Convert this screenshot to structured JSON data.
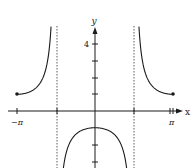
{
  "chart_data": {
    "type": "line",
    "title": "",
    "function": "y = -sec x",
    "xlabel": "x",
    "ylabel": "y",
    "xlim": [
      -3.14159,
      3.14159
    ],
    "ylim": [
      -3.4,
      5
    ],
    "x_tick_labels": [
      {
        "value": -3.14159,
        "label": "−π"
      },
      {
        "value": 3.14159,
        "label": "π"
      }
    ],
    "y_tick_labels": [
      {
        "value": 4,
        "label": "4"
      }
    ],
    "y_ticks": [
      -3,
      -2,
      -1,
      1,
      2,
      3,
      4
    ],
    "asymptotes_x": [
      -1.5708,
      1.5708
    ],
    "endpoints": [
      {
        "x": -3.14159,
        "y": 1,
        "closed": true
      },
      {
        "x": 3.14159,
        "y": 1,
        "closed": true
      }
    ],
    "series": [
      {
        "name": "left branch",
        "x_range": [
          -3.14159,
          -1.77
        ],
        "sample_points": [
          [
            -3.14159,
            1
          ],
          [
            -2.5,
            1.25
          ],
          [
            -2.0,
            2.4
          ],
          [
            -1.8,
            4.4
          ]
        ]
      },
      {
        "name": "middle branch",
        "x_range": [
          -1.35,
          1.35
        ],
        "sample_points": [
          [
            -1.3,
            -3.7
          ],
          [
            -1.0,
            -1.85
          ],
          [
            0,
            -1
          ],
          [
            1.0,
            -1.85
          ],
          [
            1.3,
            -3.7
          ]
        ]
      },
      {
        "name": "right branch",
        "x_range": [
          1.77,
          3.14159
        ],
        "sample_points": [
          [
            1.8,
            4.4
          ],
          [
            2.0,
            2.4
          ],
          [
            2.5,
            1.25
          ],
          [
            3.14159,
            1
          ]
        ]
      }
    ],
    "grid": false,
    "legend": null
  },
  "axes": {
    "x_name": "x",
    "y_name": "y",
    "neg_pi_label": "−π",
    "pi_label": "π",
    "y4_label": "4"
  },
  "colors": {
    "curve": "#1a1a1a",
    "axis": "#1a1a1a",
    "asymptote": "#333333"
  }
}
